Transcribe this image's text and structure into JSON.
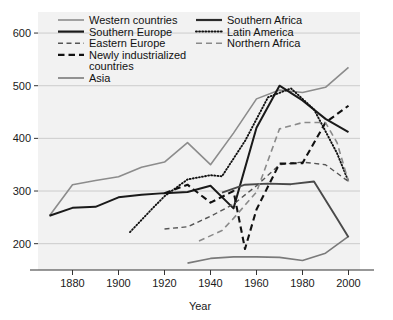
{
  "chart_data": {
    "type": "line",
    "title": "",
    "xlabel": "Year",
    "ylabel": "",
    "xlim": [
      1865,
      2005
    ],
    "ylim": [
      150,
      640
    ],
    "xticks": [
      1880,
      1900,
      1920,
      1940,
      1960,
      1980,
      2000
    ],
    "yticks": [
      200,
      300,
      400,
      500,
      600
    ],
    "grid": true,
    "legend_position": "top-inside",
    "series": [
      {
        "name": "Western countries",
        "style": "solid",
        "color": "#8c8c8c",
        "width": 1.6,
        "points": [
          [
            1870,
            253
          ],
          [
            1880,
            312
          ],
          [
            1890,
            320
          ],
          [
            1900,
            327
          ],
          [
            1910,
            345
          ],
          [
            1920,
            355
          ],
          [
            1930,
            392
          ],
          [
            1940,
            350
          ],
          [
            1950,
            410
          ],
          [
            1960,
            475
          ],
          [
            1970,
            492
          ],
          [
            1980,
            487
          ],
          [
            1990,
            497
          ],
          [
            2000,
            535
          ]
        ]
      },
      {
        "name": "Southern Europe",
        "style": "solid",
        "color": "#1a1a1a",
        "width": 2.0,
        "points": [
          [
            1870,
            253
          ],
          [
            1880,
            268
          ],
          [
            1890,
            270
          ],
          [
            1900,
            288
          ],
          [
            1910,
            293
          ],
          [
            1920,
            296
          ],
          [
            1930,
            298
          ],
          [
            1940,
            310
          ],
          [
            1950,
            267
          ],
          [
            1960,
            420
          ],
          [
            1970,
            500
          ],
          [
            1980,
            472
          ],
          [
            1990,
            437
          ],
          [
            2000,
            412
          ]
        ]
      },
      {
        "name": "Eastern Europe",
        "style": "dashed-thin",
        "color": "#555555",
        "width": 1.4,
        "points": [
          [
            1920,
            228
          ],
          [
            1930,
            232
          ],
          [
            1940,
            252
          ],
          [
            1950,
            275
          ],
          [
            1960,
            310
          ],
          [
            1970,
            350
          ],
          [
            1980,
            355
          ],
          [
            1990,
            350
          ],
          [
            2000,
            318
          ]
        ]
      },
      {
        "name": "Newly industrialized countries",
        "style": "dashed-thick",
        "color": "#111111",
        "width": 2.1,
        "points": [
          [
            1920,
            296
          ],
          [
            1930,
            312
          ],
          [
            1940,
            278
          ],
          [
            1950,
            300
          ],
          [
            1955,
            190
          ],
          [
            1960,
            265
          ],
          [
            1970,
            352
          ],
          [
            1980,
            353
          ],
          [
            1990,
            430
          ],
          [
            2000,
            462
          ]
        ]
      },
      {
        "name": "Asia",
        "style": "solid",
        "color": "#7a7a7a",
        "width": 1.6,
        "points": [
          [
            1930,
            163
          ],
          [
            1940,
            172
          ],
          [
            1950,
            175
          ],
          [
            1960,
            175
          ],
          [
            1970,
            174
          ],
          [
            1980,
            168
          ],
          [
            1990,
            182
          ],
          [
            2000,
            214
          ]
        ]
      },
      {
        "name": "Southern Africa",
        "style": "solid",
        "color": "#4a4a4a",
        "width": 1.9,
        "points": [
          [
            1945,
            297
          ],
          [
            1955,
            312
          ],
          [
            1965,
            314
          ],
          [
            1975,
            313
          ],
          [
            1985,
            318
          ],
          [
            1995,
            248
          ],
          [
            2000,
            212
          ]
        ]
      },
      {
        "name": "Latin America",
        "style": "dotted",
        "color": "#111111",
        "width": 1.9,
        "points": [
          [
            1905,
            222
          ],
          [
            1915,
            268
          ],
          [
            1920,
            290
          ],
          [
            1930,
            322
          ],
          [
            1940,
            330
          ],
          [
            1945,
            328
          ],
          [
            1955,
            395
          ],
          [
            1965,
            478
          ],
          [
            1975,
            495
          ],
          [
            1985,
            455
          ],
          [
            1995,
            372
          ],
          [
            2000,
            318
          ]
        ]
      },
      {
        "name": "Northern Africa",
        "style": "dashed-med",
        "color": "#8a8a8a",
        "width": 1.6,
        "points": [
          [
            1935,
            205
          ],
          [
            1945,
            225
          ],
          [
            1950,
            248
          ],
          [
            1960,
            298
          ],
          [
            1970,
            418
          ],
          [
            1980,
            430
          ],
          [
            1990,
            430
          ],
          [
            1995,
            392
          ],
          [
            2000,
            318
          ]
        ]
      }
    ],
    "legend": [
      {
        "label": "Western countries",
        "style": "solid",
        "color": "#8c8c8c",
        "width": 1.6
      },
      {
        "label": "Southern Europe",
        "style": "solid",
        "color": "#1a1a1a",
        "width": 2.2
      },
      {
        "label": "Eastern Europe",
        "style": "dashed-thin",
        "color": "#555555",
        "width": 1.5
      },
      {
        "label": "Newly industrialized",
        "style": "dashed-thick",
        "color": "#111111",
        "width": 2.2
      },
      {
        "label": "countries",
        "style": "none",
        "color": "#000000",
        "width": 0
      },
      {
        "label": "Asia",
        "style": "solid",
        "color": "#7a7a7a",
        "width": 1.6
      },
      {
        "label": "Southern Africa",
        "style": "solid",
        "color": "#2b2b2b",
        "width": 2.2
      },
      {
        "label": "Latin America",
        "style": "dotted",
        "color": "#111111",
        "width": 2.0
      },
      {
        "label": "Northern Africa",
        "style": "dashed-med",
        "color": "#8a8a8a",
        "width": 1.6
      }
    ]
  },
  "axis": {
    "x_title": "Year",
    "y_tick_600": "600",
    "y_tick_500": "500",
    "y_tick_400": "400",
    "y_tick_300": "300",
    "y_tick_200": "200",
    "x_tick_1880": "1880",
    "x_tick_1900": "1900",
    "x_tick_1920": "1920",
    "x_tick_1940": "1940",
    "x_tick_1960": "1960",
    "x_tick_1980": "1980",
    "x_tick_2000": "2000"
  },
  "legend_text": {
    "l0": "Western countries",
    "l1": "Southern Europe",
    "l2": "Eastern Europe",
    "l3": "Newly industrialized",
    "l4": "countries",
    "l5": "Asia",
    "r0": "Southern Africa",
    "r1": "Latin America",
    "r2": "Northern Africa"
  },
  "colors": {
    "plot_background": "#f2f2f2",
    "gridline": "#cccccc",
    "axis": "#333333",
    "page_background": "#ffffff"
  }
}
